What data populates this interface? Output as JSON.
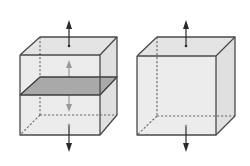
{
  "figure": {
    "colors": {
      "background": "#ffffff",
      "face_fill": "#ececec",
      "top_face_fill": "#e4e4e4",
      "side_face_fill": "#e0e0e0",
      "edge": "#4a4a4a",
      "hidden_edge": "#6a6a6a",
      "plane_fill": "#a9a9a9",
      "plane_edge": "#3c3c3c",
      "outer_arrow": "#2a2a2a",
      "inner_arrow": "#9a9a9a"
    },
    "cubes": [
      {
        "name": "left-cube",
        "has_mid_plane": true,
        "outer_arrows": [
          "up",
          "down"
        ],
        "inner_arrows": [
          "up",
          "down"
        ]
      },
      {
        "name": "right-cube",
        "has_mid_plane": false,
        "outer_arrows": [
          "up",
          "down"
        ],
        "inner_arrows": []
      }
    ]
  }
}
